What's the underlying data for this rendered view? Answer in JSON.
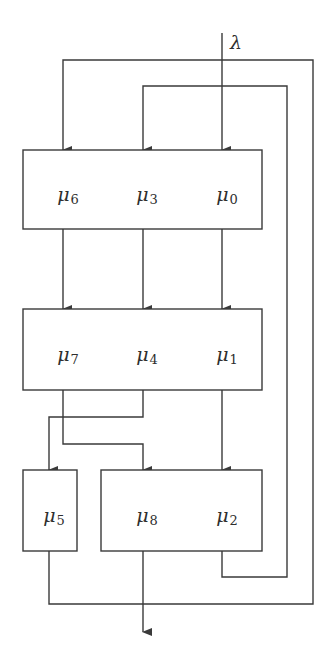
{
  "diagram": {
    "input_label": "λ",
    "colors": {
      "line": "#3a3a3a",
      "text": "#2e2e2e",
      "background": "#ffffff"
    },
    "stages": [
      {
        "name": "stage-1",
        "nodes": [
          {
            "symbol": "μ",
            "index": "6"
          },
          {
            "symbol": "μ",
            "index": "3"
          },
          {
            "symbol": "μ",
            "index": "0"
          }
        ]
      },
      {
        "name": "stage-2",
        "nodes": [
          {
            "symbol": "μ",
            "index": "7"
          },
          {
            "symbol": "μ",
            "index": "4"
          },
          {
            "symbol": "μ",
            "index": "1"
          }
        ]
      },
      {
        "name": "stage-3a",
        "nodes": [
          {
            "symbol": "μ",
            "index": "5"
          }
        ]
      },
      {
        "name": "stage-3b",
        "nodes": [
          {
            "symbol": "μ",
            "index": "8"
          },
          {
            "symbol": "μ",
            "index": "2"
          }
        ]
      }
    ],
    "connections": [
      {
        "from": "λ",
        "to": "μ0"
      },
      {
        "from": "μ6",
        "to": "μ7"
      },
      {
        "from": "μ3",
        "to": "μ4"
      },
      {
        "from": "μ0",
        "to": "μ1"
      },
      {
        "from": "μ4",
        "to": "μ5"
      },
      {
        "from": "μ7",
        "to": "μ8"
      },
      {
        "from": "μ1",
        "to": "μ2"
      },
      {
        "from": "μ2",
        "to": "μ3",
        "type": "feedback-inner"
      },
      {
        "from": "μ5",
        "to": "μ6",
        "type": "feedback-outer"
      },
      {
        "from": "μ8",
        "to": "output"
      }
    ]
  }
}
